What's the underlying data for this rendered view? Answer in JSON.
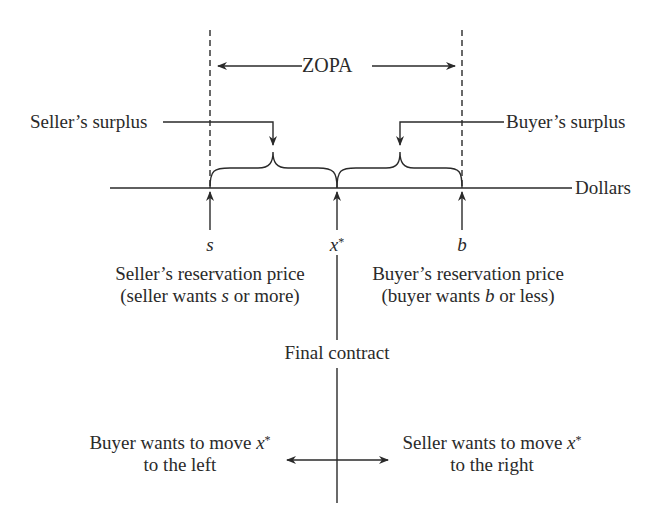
{
  "diagram": {
    "title": "ZOPA",
    "axis_label": "Dollars",
    "labels": {
      "zopa": "ZOPA",
      "sellers_surplus": "Seller’s surplus",
      "buyers_surplus": "Buyer’s surplus",
      "dollars": "Dollars",
      "s": "s",
      "x_var": "x",
      "x_star": "*",
      "b": "b",
      "seller_reservation_line1": "Seller’s reservation price",
      "seller_reservation_line2_pre": "(seller wants ",
      "seller_reservation_line2_var": "s",
      "seller_reservation_line2_post": " or more)",
      "buyer_reservation_line1": "Buyer’s reservation price",
      "buyer_reservation_line2_pre": "(buyer wants ",
      "buyer_reservation_line2_var": "b",
      "buyer_reservation_line2_post": " or less)",
      "final_contract": "Final contract",
      "buyer_move_line1_pre": "Buyer wants to move ",
      "buyer_move_var": "x",
      "buyer_move_star": "*",
      "buyer_move_line2": "to the left",
      "seller_move_line1_pre": "Seller wants to move ",
      "seller_move_var": "x",
      "seller_move_star": "*",
      "seller_move_line2": "to the right"
    },
    "points": [
      {
        "name": "s",
        "meaning": "Seller’s reservation price",
        "x_px": 210
      },
      {
        "name": "x*",
        "meaning": "Final contract",
        "x_px": 337
      },
      {
        "name": "b",
        "meaning": "Buyer’s reservation price",
        "x_px": 462
      }
    ],
    "colors": {
      "line": "#2a2a2a",
      "background": "#ffffff"
    }
  }
}
